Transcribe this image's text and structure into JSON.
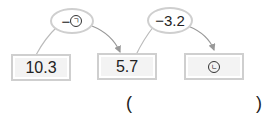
{
  "diagram": {
    "boxes": [
      {
        "id": "start",
        "value": "10.3"
      },
      {
        "id": "middle",
        "value": "5.7"
      },
      {
        "id": "end",
        "value": "ㄴ"
      }
    ],
    "operations": [
      {
        "label": "−",
        "symbol": "ㄱ"
      },
      {
        "label": "−3.2"
      }
    ],
    "answer": {
      "open": "(",
      "close": ")"
    }
  }
}
